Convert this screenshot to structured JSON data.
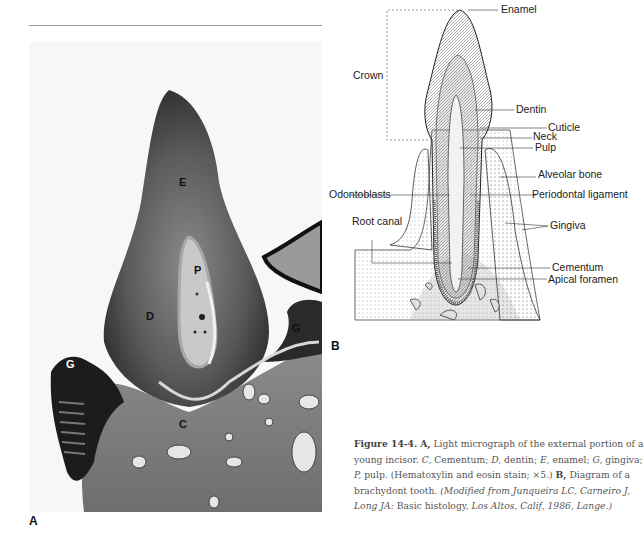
{
  "figure": {
    "panel_a_label": "A",
    "panel_b_label": "B",
    "micrograph_labels": {
      "enamel": "E",
      "pulp": "P",
      "dentin": "D",
      "gingiva_left": "G",
      "gingiva_right": "G",
      "cementum": "C"
    },
    "diagram_labels": {
      "enamel": "Enamel",
      "crown": "Crown",
      "dentin": "Dentin",
      "cuticle": "Cuticle",
      "neck": "Neck",
      "pulp": "Pulp",
      "alveolar_bone": "Alveolar bone",
      "odontoblasts": "Odontoblasts",
      "periodontal_ligament": "Periodontal ligament",
      "root_canal": "Root canal",
      "gingiva": "Gingiva",
      "cementum": "Cementum",
      "apical_foramen": "Apical foramen"
    }
  },
  "caption": {
    "figure_number": "Figure 14-4.",
    "a_marker": "A,",
    "a_text": "Light micrograph of the external portion of a young incisor.",
    "abbr_c": "C,",
    "abbr_c_text": "Cementum;",
    "abbr_d": "D,",
    "abbr_d_text": "dentin;",
    "abbr_e": "E,",
    "abbr_e_text": "enamel;",
    "abbr_g": "G,",
    "abbr_g_text": "gingiva;",
    "abbr_p": "P,",
    "abbr_p_text": "pulp.",
    "stain": "(Hematoxylin and eosin stain; ×5.)",
    "b_marker": "B,",
    "b_text": "Diagram of a brachydont tooth.",
    "source_italic": "(Modified from Junqueira LC, Carneiro J, Long JA:",
    "source_title": "Basic histology,",
    "source_place": "Los Altos, Calif,",
    "source_year": "1986, Lange.)"
  }
}
